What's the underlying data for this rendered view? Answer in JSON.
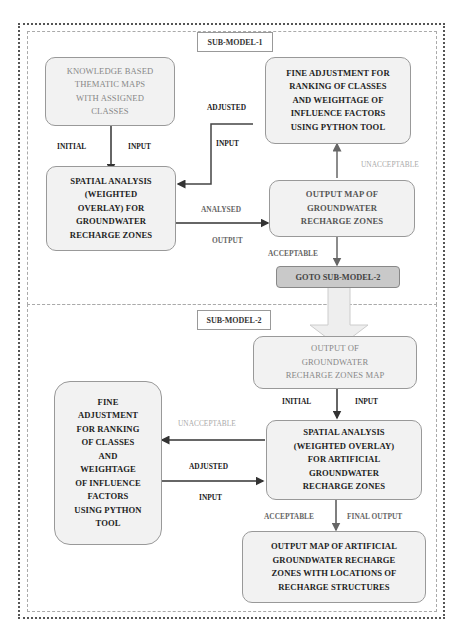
{
  "diagram": {
    "submodels": [
      {
        "title": "SUB-MODEL-1",
        "nodes": {
          "knowledge": "KNOWLEDGE BASED\nTHEMATIC MAPS\nWITH ASSIGNED\nCLASSES",
          "fine_adjust": "FINE ADJUSTMENT FOR\nRANKING OF CLASSES\nAND WEIGHTAGE OF\nINFLUENCE FACTORS\nUSING PYTHON TOOL",
          "spatial": "SPATIAL ANALYSIS\n(WEIGHTED\nOVERLAY) FOR\nGROUNDWATER\nRECHARGE ZONES",
          "output_map": "OUTPUT MAP OF\nGROUNDWATER\nRECHARGE ZONES",
          "goto": "GOTO SUB-MODEL-2"
        },
        "edge_labels": {
          "initial": "INITIAL",
          "input": "INPUT",
          "adjusted": "ADJUSTED",
          "adjusted_input": "INPUT",
          "unacceptable": "UNACCEPTABLE",
          "analysed": "ANALYSED",
          "output": "OUTPUT",
          "acceptable": "ACCEPTABLE"
        }
      },
      {
        "title": "SUB-MODEL-2",
        "nodes": {
          "output_input": "OUTPUT OF\nGROUNDWATER\nRECHARGE ZONES MAP",
          "fine_adjust": "FINE\nADJUSTMENT\nFOR RANKING\nOF CLASSES\nAND\nWEIGHTAGE\nOF INFLUENCE\nFACTORS\nUSING PYTHON\nTOOL",
          "spatial": "SPATIAL ANALYSIS\n(WEIGHTED OVERLAY)\nFOR ARTIFICIAL\nGROUNDWATER\nRECHARGE ZONES",
          "final_map": "OUTPUT MAP OF ARTIFICIAL\nGROUNDWATER  RECHARGE\nZONES WITH LOCATIONS OF\nRECHARGE STRUCTURES"
        },
        "edge_labels": {
          "initial": "INITIAL",
          "input": "INPUT",
          "unacceptable": "UNACCEPTABLE",
          "adjusted": "ADJUSTED",
          "adjusted_input": "INPUT",
          "acceptable": "ACCEPTABLE",
          "final_output": "FINAL OUTPUT"
        }
      }
    ]
  }
}
